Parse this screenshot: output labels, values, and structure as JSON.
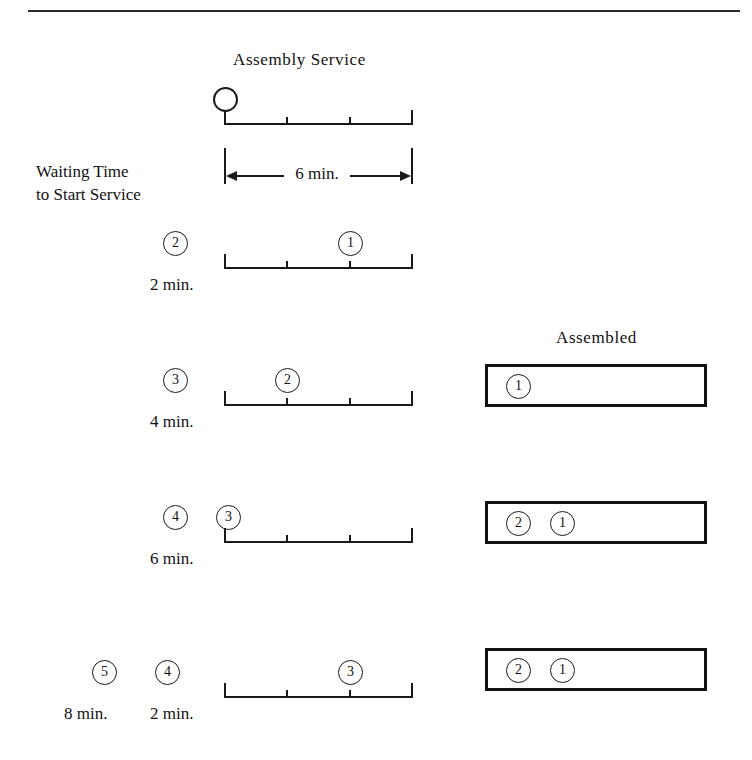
{
  "diagram": {
    "title": "Assembly Service",
    "assembled_title": "Assembled",
    "waiting_label_line1": "Waiting Time",
    "waiting_label_line2": "to Start Service",
    "dimension_label": "6 min.",
    "service_duration_minutes": 6,
    "tick_count": 2,
    "ink_color": "#111111"
  },
  "rows": [
    {
      "id": "row-0",
      "service_bar": {
        "token": "",
        "token_empty": true,
        "position_fraction": 0.0
      },
      "waiting": [],
      "assembled": null
    },
    {
      "id": "row-1",
      "service_bar": {
        "token": "1",
        "position_fraction": 0.667
      },
      "waiting": [
        {
          "token": "2",
          "time": "2 min."
        }
      ],
      "assembled": null
    },
    {
      "id": "row-2",
      "service_bar": {
        "token": "2",
        "position_fraction": 0.333
      },
      "waiting": [
        {
          "token": "3",
          "time": "4 min."
        }
      ],
      "assembled": {
        "tokens": [
          "1"
        ]
      }
    },
    {
      "id": "row-3",
      "service_bar": {
        "token": "3",
        "position_fraction": 0.0
      },
      "waiting": [
        {
          "token": "4",
          "time": "6 min."
        }
      ],
      "assembled": {
        "tokens": [
          "2",
          "1"
        ]
      }
    },
    {
      "id": "row-4",
      "service_bar": {
        "token": "3",
        "position_fraction": 0.667
      },
      "waiting": [
        {
          "token": "5",
          "time": "8 min."
        },
        {
          "token": "4",
          "time": "2 min."
        }
      ],
      "assembled": {
        "tokens": [
          "2",
          "1"
        ]
      }
    }
  ]
}
